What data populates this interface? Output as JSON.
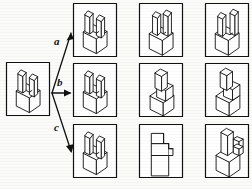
{
  "figure": {
    "type": "mental-rotation-task",
    "title": "",
    "background_color": "#fbfbf9",
    "ink_color": "#111111"
  },
  "reference": {
    "label": "reference-object",
    "box": {
      "x": 6,
      "y": 62,
      "w": 44,
      "h": 54
    },
    "description": "cube with two upright fins"
  },
  "arrows": [
    {
      "id": "a",
      "label": "a",
      "label_x": 55,
      "label_y": 42,
      "from": [
        52,
        93
      ],
      "to": [
        72,
        32
      ],
      "direction": "up-right"
    },
    {
      "id": "b",
      "label": "b",
      "label_x": 57,
      "label_y": 80,
      "from": [
        52,
        93
      ],
      "to": [
        72,
        93
      ],
      "direction": "right"
    },
    {
      "id": "c",
      "label": "c",
      "label_x": 55,
      "label_y": 128,
      "from": [
        52,
        93
      ],
      "to": [
        72,
        152
      ],
      "direction": "down-right"
    }
  ],
  "grid": {
    "rows": 3,
    "cols": 3,
    "cell_w": 44,
    "cell_h": 54,
    "origin_x": 73,
    "origin_y": 3,
    "gap_x": 22,
    "gap_y": 6,
    "cells": [
      {
        "row": 0,
        "col": 0,
        "name": "cell-r1c1",
        "variant": "cube-two-fins-upright"
      },
      {
        "row": 0,
        "col": 1,
        "name": "cell-r1c2",
        "variant": "cube-two-fins-rotated"
      },
      {
        "row": 0,
        "col": 2,
        "name": "cell-r1c3",
        "variant": "cube-two-fins-rotated-alt"
      },
      {
        "row": 1,
        "col": 0,
        "name": "cell-r2c1",
        "variant": "cube-two-fins-upright"
      },
      {
        "row": 1,
        "col": 1,
        "name": "cell-r2c2",
        "variant": "stepped-block-angled"
      },
      {
        "row": 1,
        "col": 2,
        "name": "cell-r2c3",
        "variant": "stepped-block-angled-alt"
      },
      {
        "row": 2,
        "col": 0,
        "name": "cell-r3c1",
        "variant": "cube-two-fins-upright"
      },
      {
        "row": 2,
        "col": 1,
        "name": "cell-r3c2",
        "variant": "stepped-block-frontal"
      },
      {
        "row": 2,
        "col": 2,
        "name": "cell-r3c3",
        "variant": "stepped-block-tall"
      }
    ]
  }
}
